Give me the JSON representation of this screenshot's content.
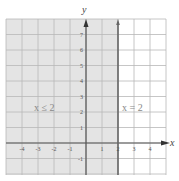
{
  "chart_data": {
    "type": "line",
    "title": "",
    "xlabel": "x",
    "ylabel": "y",
    "xlim": [
      -5,
      5
    ],
    "ylim": [
      -2,
      8
    ],
    "grid": true,
    "x_ticks": [
      -4,
      -3,
      -2,
      -1,
      1,
      2,
      3,
      4
    ],
    "x_tick_labels": [
      "-4",
      "-3",
      "-2",
      "-1",
      "1",
      "2",
      "3",
      "4"
    ],
    "y_ticks": [
      7,
      6,
      5,
      4,
      3,
      2,
      1,
      -1
    ],
    "y_tick_labels": [
      "7",
      "6",
      "5",
      "4",
      "3",
      "2",
      "1",
      "-1"
    ],
    "boundary_line": {
      "equation": "x = 2",
      "x": 2
    },
    "shaded_region": {
      "inequality": "x ≤ 2",
      "x_max": 2
    },
    "annotations": [
      {
        "text": "x ≤ 2",
        "x": -3,
        "y": 2.5
      },
      {
        "text": "x = 2",
        "x": 3.2,
        "y": 2.5
      }
    ],
    "colors": {
      "shade": "#e4e4e4",
      "grid": "#b8b8b8",
      "axis": "#555555",
      "boundary": "#666666"
    }
  }
}
